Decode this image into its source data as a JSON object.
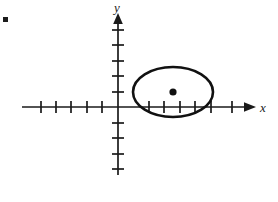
{
  "figure": {
    "background_color": "#ffffff",
    "stroke_color": "#1a1a1a",
    "width": 278,
    "height": 202
  },
  "axes": {
    "x_label": "x",
    "y_label": "y",
    "origin": {
      "x": 118,
      "y": 107
    },
    "tick_spacing": 15.5,
    "x_axis": {
      "start_x": 22,
      "end_x": 250,
      "arrow": "right",
      "tick_half_length": 6,
      "ticks_negative": 5,
      "ticks_positive": 6,
      "negative_tick_x": [
        41,
        56,
        71,
        87,
        102
      ],
      "positive_tick_x": [
        149,
        164,
        180,
        195,
        211,
        232
      ]
    },
    "y_axis": {
      "start_y": 175,
      "end_y": 17,
      "arrow": "up",
      "tick_half_length": 6,
      "ticks_above": 5,
      "ticks_below": 5,
      "above_tick_y": [
        92,
        76,
        61,
        45,
        30
      ],
      "below_tick_y": [
        123,
        138,
        154,
        169
      ]
    }
  },
  "chart_data": {
    "type": "scatter",
    "xlabel": "x",
    "ylabel": "y",
    "grid": false,
    "legend": null,
    "annotations": [],
    "shapes": [
      {
        "name": "ellipse",
        "type": "ellipse",
        "center_px": {
          "x": 173,
          "y": 92
        },
        "center_units": {
          "x": 3.5,
          "y": 1.0
        },
        "radius_x_px": 40,
        "radius_y_px": 25,
        "radius_x_units": 2.6,
        "radius_y_units": 1.6,
        "stroke_color": "#111111",
        "stroke_width": 2.6,
        "fill": "none"
      },
      {
        "name": "center-point",
        "type": "point",
        "center_px": {
          "x": 173,
          "y": 92
        },
        "center_units": {
          "x": 3.5,
          "y": 1.0
        },
        "radius_px": 3.6,
        "fill": "#111111"
      }
    ],
    "x": [
      3.5
    ],
    "y": [
      1.0
    ],
    "xlim": [
      -6.2,
      8.5
    ],
    "ylim": [
      -4.4,
      5.8
    ]
  },
  "artifacts": {
    "corner_mark": {
      "label": "scan-speck",
      "x": 3,
      "y": 17,
      "width": 5,
      "height": 5,
      "color": "#1c1c1c"
    }
  }
}
